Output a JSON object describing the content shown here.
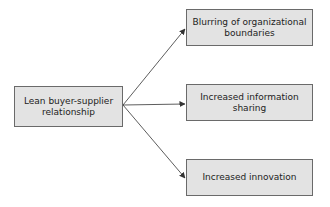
{
  "diagram": {
    "source": {
      "label": "Lean buyer-supplier\nrelationship"
    },
    "targets": [
      {
        "label": "Blurring of organizational\nboundaries"
      },
      {
        "label": "Increased information\nsharing"
      },
      {
        "label": "Increased innovation"
      }
    ],
    "edges": [
      {
        "from": "source",
        "to": "targets.0"
      },
      {
        "from": "source",
        "to": "targets.1"
      },
      {
        "from": "source",
        "to": "targets.2"
      }
    ],
    "colors": {
      "box_fill": "#e3e3e3",
      "box_border": "#6a6a6a",
      "arrow": "#333333",
      "text": "#222222"
    }
  }
}
